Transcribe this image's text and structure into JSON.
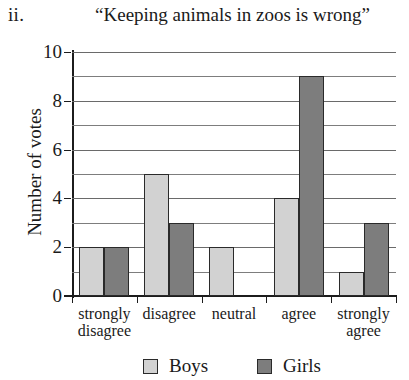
{
  "figure": {
    "number_label": "ii.",
    "title": "“Keeping animals in zoos is wrong”"
  },
  "chart_data": {
    "type": "bar",
    "title": "“Keeping animals in zoos is wrong”",
    "xlabel": "",
    "ylabel": "Number of votes",
    "ylim": [
      0,
      10
    ],
    "ytick_labels": [
      "0",
      "2",
      "4",
      "6",
      "8",
      "10"
    ],
    "ytick_values": [
      0,
      2,
      4,
      6,
      8,
      10
    ],
    "grid": true,
    "grid_interval": 1,
    "legend_position": "bottom",
    "categories": [
      "strongly disagree",
      "disagree",
      "neutral",
      "agree",
      "strongly agree"
    ],
    "category_lines": [
      [
        "strongly",
        "disagree"
      ],
      [
        "disagree",
        ""
      ],
      [
        "neutral",
        ""
      ],
      [
        "agree",
        ""
      ],
      [
        "strongly",
        "agree"
      ]
    ],
    "series": [
      {
        "name": "Boys",
        "color": "#d2d2d2",
        "values": [
          2,
          5,
          2,
          4,
          1
        ]
      },
      {
        "name": "Girls",
        "color": "#7d7d7d",
        "values": [
          2,
          3,
          0,
          9,
          3
        ]
      }
    ]
  },
  "legend": {
    "items": [
      {
        "label": "Boys",
        "swatch": "boys-swatch"
      },
      {
        "label": "Girls",
        "swatch": "girls-swatch"
      }
    ]
  }
}
